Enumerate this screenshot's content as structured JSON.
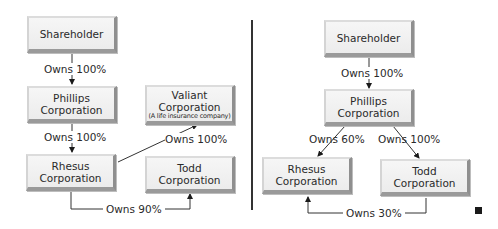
{
  "left_diagram": {
    "shareholder": "Shareholder",
    "phillips": [
      "Phillips",
      "Corporation"
    ],
    "valiant": [
      "Valiant",
      "Corporation",
      "(A life insurance company)"
    ],
    "rhesus": [
      "Rhesus",
      "Corporation"
    ],
    "todd": [
      "Todd",
      "Corporation"
    ],
    "edges": {
      "shareholder_phillips": "Owns 100%",
      "phillips_rhesus": "Owns 100%",
      "rhesus_valiant": "Owns 100%",
      "rhesus_todd": "Owns 90%"
    }
  },
  "right_diagram": {
    "shareholder": "Shareholder",
    "phillips": [
      "Phillips",
      "Corporation"
    ],
    "rhesus": [
      "Rhesus",
      "Corporation"
    ],
    "todd": [
      "Todd",
      "Corporation"
    ],
    "edges": {
      "shareholder_phillips": "Owns 100%",
      "phillips_rhesus": "Owns 60%",
      "phillips_todd": "Owns 100%",
      "todd_rhesus": "Owns 30%"
    }
  }
}
